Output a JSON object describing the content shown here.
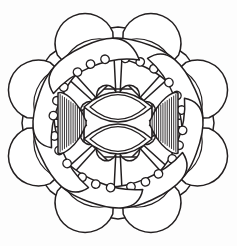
{
  "artwork": {
    "title": "Floral Mandala Line Drawing",
    "subject": "mandala",
    "style": "black ink outline coloring page",
    "symmetry_order": 8,
    "center": {
      "x": 118,
      "y": 123
    },
    "canvas": {
      "width": 237,
      "height": 246
    },
    "colors": {
      "background": "#fdfdfd",
      "ink": "#231f20",
      "fill": "#ffffff"
    },
    "layers": [
      {
        "name": "outer-scallop-ring",
        "description": "eight rounded scallop petals forming the outer silhouette",
        "count": 8,
        "radius": 96,
        "petal_half_width": 40
      },
      {
        "name": "banded-wedge-ring",
        "description": "eight wedge spokes striped with concentric arc bands",
        "count": 8,
        "inner_radius": 30,
        "outer_radius": 86,
        "bands": 3
      },
      {
        "name": "dotted-crescent-ring",
        "description": "eight tilted crescent blades, each carrying three small circles",
        "count": 8,
        "dots_per_petal": 3,
        "dot_radius": 4.2,
        "tilt_degrees": 20
      },
      {
        "name": "center-lens-pair",
        "description": "two stacked horizontal almond lenses with double outline",
        "count": 2,
        "lens_half_width": 34,
        "lens_half_height": 15
      },
      {
        "name": "center-hatched-fans",
        "description": "hatched fan wedges flanking the lens pair at left and right",
        "count": 2,
        "hatch_lines": 13
      }
    ],
    "element_labels": {
      "outer_petal": "outer scallop petal",
      "wedge": "banded wedge spoke",
      "crescent": "dotted crescent petal",
      "dot": "petal dot",
      "lens_top": "upper center lens",
      "lens_bottom": "lower center lens",
      "fan_left": "left hatched fan",
      "fan_right": "right hatched fan"
    }
  }
}
